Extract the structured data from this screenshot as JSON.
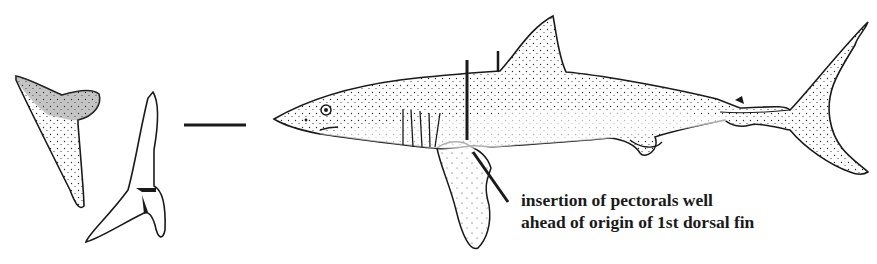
{
  "figure": {
    "colors": {
      "ink": "#1a1a1a",
      "background": "#ffffff",
      "stipple": "#2a2a2a"
    },
    "elements": {
      "upper_tooth": "upper-tooth-illustration",
      "lower_tooth": "lower-tooth-illustration",
      "scale_bar": "scale-bar",
      "shark_body": "shark-lateral-view",
      "pectoral_marker": "pectoral-insertion-marker-line",
      "dorsal_marker": "dorsal-origin-marker-line",
      "pointer": "annotation-pointer-line"
    },
    "annotation": {
      "line1": "insertion of pectorals well",
      "line2": "ahead of origin of 1st dorsal fin"
    }
  }
}
